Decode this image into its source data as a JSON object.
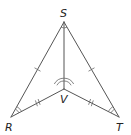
{
  "diagram": {
    "type": "geometry-figure",
    "vertices": {
      "S": {
        "label": "S",
        "x": 64,
        "y": 22
      },
      "V": {
        "label": "V",
        "x": 64,
        "y": 89
      },
      "R": {
        "label": "R",
        "x": 11,
        "y": 117
      },
      "T": {
        "label": "T",
        "x": 119,
        "y": 117
      }
    },
    "segments": [
      {
        "from": "S",
        "to": "R",
        "tick_marks": 1
      },
      {
        "from": "S",
        "to": "T",
        "tick_marks": 1
      },
      {
        "from": "S",
        "to": "V",
        "tick_marks": 0
      },
      {
        "from": "R",
        "to": "V",
        "tick_marks": 2
      },
      {
        "from": "T",
        "to": "V",
        "tick_marks": 2
      }
    ],
    "angle_marks": [
      {
        "vertex": "V",
        "arcs": 2,
        "description": "angle RVS and angle SVT marked congruent"
      },
      {
        "vertex": "R",
        "arcs": 2,
        "description": "angle SRV"
      },
      {
        "vertex": "T",
        "arcs": 2,
        "description": "angle STV"
      },
      {
        "vertex": "S",
        "arcs": 1,
        "description": "angle at S"
      }
    ],
    "colors": {
      "line": "#555555",
      "label": "#222222",
      "background": "#ffffff"
    }
  }
}
